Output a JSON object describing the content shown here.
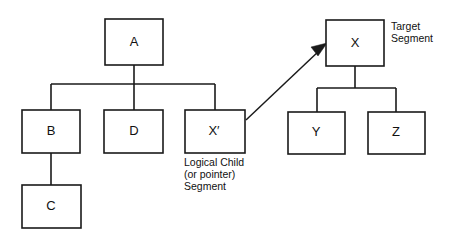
{
  "diagram": {
    "kind": "hierarchical-database-segment-diagram",
    "background_color": "#ffffff",
    "line_color": "#1a1a1a",
    "text_color": "#111111",
    "left_tree": {
      "root": {
        "id": "A",
        "label": "A",
        "x": 105,
        "y": 19,
        "w": 58,
        "h": 46
      },
      "children": [
        {
          "id": "B",
          "label": "B",
          "x": 22,
          "y": 110,
          "w": 58,
          "h": 43
        },
        {
          "id": "D",
          "label": "D",
          "x": 104,
          "y": 110,
          "w": 59,
          "h": 43
        },
        {
          "id": "Xprime",
          "label": "X′",
          "x": 185,
          "y": 110,
          "w": 60,
          "h": 43
        }
      ],
      "grandchildren": [
        {
          "id": "C",
          "label": "C",
          "parent": "B",
          "x": 22,
          "y": 185,
          "w": 59,
          "h": 43
        }
      ]
    },
    "right_tree": {
      "root": {
        "id": "X",
        "label": "X",
        "x": 326,
        "y": 20,
        "w": 58,
        "h": 46
      },
      "children": [
        {
          "id": "Y",
          "label": "Y",
          "x": 288,
          "y": 112,
          "w": 57,
          "h": 42
        },
        {
          "id": "Z",
          "label": "Z",
          "x": 368,
          "y": 112,
          "w": 57,
          "h": 42
        }
      ]
    },
    "pointer": {
      "from_node": "Xprime",
      "to_node": "X",
      "x1": 246,
      "y1": 120,
      "x2": 327,
      "y2": 44,
      "has_arrowhead": true
    },
    "captions": {
      "logical_child": {
        "lines": [
          "Logical Child",
          "(or pointer)",
          "Segment"
        ],
        "x": 184,
        "y": 166
      },
      "target": {
        "lines": [
          "Target",
          "Segment"
        ],
        "x": 391,
        "y": 30
      }
    }
  }
}
